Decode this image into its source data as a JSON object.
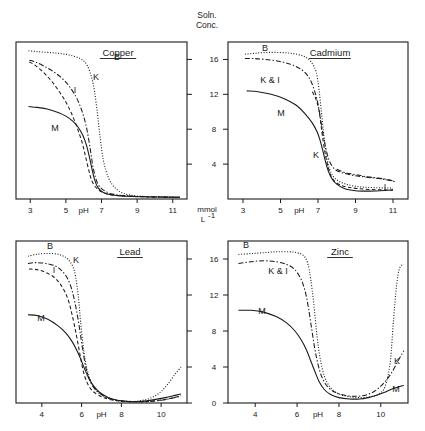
{
  "figure": {
    "axis_title_line1": "Soln.",
    "axis_title_line2": "Conc.",
    "unit_line1": "mmol",
    "unit_line2": "L",
    "unit_sup": "-1",
    "xlabel": "pH"
  },
  "chart_data": [
    {
      "type": "line",
      "title": "Copper",
      "panel": "top-left",
      "xlabel": "pH",
      "ylabel": "Soln. Conc. (mmol L-1)",
      "xlim": [
        2.2,
        11.8
      ],
      "ylim": [
        0,
        18
      ],
      "xticks": [
        3,
        5,
        7,
        9,
        11
      ],
      "xtick_labels": [
        "3",
        "5",
        "7",
        "9",
        "11"
      ],
      "yticks": [
        4,
        8,
        12,
        16
      ],
      "ytick_labels": [
        "4",
        "8",
        "12",
        "16"
      ],
      "grid": false,
      "legend": "inline curve labels",
      "series": [
        {
          "name": "B",
          "label": "B",
          "style": "dotted",
          "x": [
            2.9,
            3.4,
            4.0,
            4.6,
            5.2,
            5.8,
            6.2,
            6.5,
            6.7,
            6.9,
            7.1,
            7.4,
            7.8,
            8.3,
            9.0,
            10.0,
            11.4
          ],
          "y": [
            17.0,
            16.9,
            16.8,
            16.7,
            16.5,
            16.1,
            15.3,
            13.5,
            11.0,
            7.5,
            4.5,
            2.4,
            1.2,
            0.6,
            0.35,
            0.25,
            0.2
          ]
        },
        {
          "name": "K",
          "label": "K",
          "style": "dash-dot",
          "x": [
            2.95,
            3.3,
            3.8,
            4.3,
            4.8,
            5.2,
            5.6,
            5.9,
            6.1,
            6.25,
            6.4,
            6.55,
            6.8,
            7.2,
            7.8,
            8.6,
            9.6,
            11.4
          ],
          "y": [
            15.9,
            15.7,
            15.2,
            14.6,
            13.8,
            12.9,
            11.6,
            10.1,
            8.7,
            7.2,
            5.3,
            3.4,
            1.7,
            0.9,
            0.5,
            0.35,
            0.25,
            0.2
          ]
        },
        {
          "name": "I",
          "label": "I",
          "style": "dashed",
          "x": [
            2.95,
            3.3,
            3.8,
            4.2,
            4.6,
            4.95,
            5.25,
            5.5,
            5.75,
            5.95,
            6.1,
            6.3,
            6.5,
            6.9,
            7.5,
            8.3,
            9.4,
            11.4
          ],
          "y": [
            15.7,
            15.3,
            14.4,
            13.5,
            12.4,
            11.3,
            10.1,
            8.9,
            7.5,
            6.2,
            4.9,
            3.2,
            1.9,
            0.95,
            0.5,
            0.35,
            0.25,
            0.2
          ]
        },
        {
          "name": "M",
          "label": "M",
          "style": "solid",
          "x": [
            2.9,
            3.4,
            4.0,
            4.6,
            5.0,
            5.4,
            5.7,
            5.95,
            6.15,
            6.3,
            6.45,
            6.6,
            6.8,
            7.1,
            7.6,
            8.3,
            9.3,
            11.4
          ],
          "y": [
            10.6,
            10.5,
            10.3,
            9.9,
            9.5,
            8.9,
            8.2,
            7.3,
            6.2,
            5.0,
            3.6,
            2.3,
            1.3,
            0.75,
            0.45,
            0.32,
            0.25,
            0.2
          ]
        }
      ]
    },
    {
      "type": "line",
      "title": "Cadmium",
      "panel": "top-right",
      "xlabel": "pH",
      "ylabel": "Soln. Conc. (mmol L-1)",
      "xlim": [
        2.2,
        11.8
      ],
      "ylim": [
        0,
        18
      ],
      "xticks": [
        3,
        5,
        7,
        9,
        11
      ],
      "xtick_labels": [
        "3",
        "5",
        "7",
        "9",
        "11"
      ],
      "yticks": [
        4,
        8,
        12,
        16
      ],
      "ytick_labels": [
        "4",
        "8",
        "12",
        "16"
      ],
      "grid": false,
      "legend": "inline curve labels",
      "series": [
        {
          "name": "B",
          "label": "B",
          "style": "dotted",
          "x": [
            3.1,
            3.6,
            4.2,
            4.9,
            5.6,
            6.2,
            6.6,
            6.9,
            7.05,
            7.2,
            7.35,
            7.5,
            7.7,
            8.0,
            8.5,
            9.2,
            10.0,
            11.0
          ],
          "y": [
            16.6,
            16.7,
            16.8,
            16.8,
            16.7,
            16.4,
            15.8,
            14.6,
            12.6,
            9.6,
            6.6,
            4.4,
            3.0,
            2.2,
            1.7,
            1.4,
            1.3,
            1.25
          ]
        },
        {
          "name": "K",
          "label": "K & I",
          "style": "dash-dot",
          "x": [
            3.1,
            3.6,
            4.2,
            4.9,
            5.6,
            6.2,
            6.6,
            6.9,
            7.05,
            7.2,
            7.4,
            7.6,
            7.9,
            8.3,
            8.9,
            9.6,
            10.4,
            11.1
          ],
          "y": [
            16.1,
            16.1,
            16.0,
            15.8,
            15.4,
            14.7,
            13.6,
            11.8,
            10.3,
            8.3,
            6.0,
            4.4,
            3.4,
            3.0,
            2.7,
            2.5,
            2.3,
            2.0
          ]
        },
        {
          "name": "K2",
          "label": "K",
          "style": "dashed",
          "x": [
            6.7,
            6.9,
            7.05,
            7.15,
            7.25,
            7.4,
            7.55,
            7.7,
            7.9,
            8.2,
            8.6,
            9.1,
            9.7,
            10.4,
            11.0
          ],
          "y": [
            12.3,
            11.4,
            10.2,
            8.7,
            7.0,
            5.0,
            3.6,
            2.6,
            2.0,
            1.6,
            1.35,
            1.2,
            1.1,
            1.05,
            1.0
          ]
        },
        {
          "name": "I",
          "label": "I",
          "style": "dash-dot",
          "x": [
            8.0,
            8.5,
            9.0,
            9.6,
            10.2,
            10.8,
            11.1
          ],
          "y": [
            3.4,
            3.0,
            2.8,
            2.55,
            2.4,
            2.2,
            2.0
          ]
        },
        {
          "name": "M",
          "label": "M",
          "style": "solid",
          "x": [
            3.2,
            3.8,
            4.5,
            5.2,
            5.8,
            6.3,
            6.7,
            6.95,
            7.1,
            7.25,
            7.4,
            7.55,
            7.75,
            8.0,
            8.4,
            9.0,
            9.6,
            10.3,
            11.0
          ],
          "y": [
            12.4,
            12.3,
            12.0,
            11.5,
            10.8,
            9.8,
            8.7,
            7.7,
            6.8,
            5.6,
            4.3,
            3.2,
            2.3,
            1.7,
            1.2,
            0.95,
            0.9,
            0.95,
            1.05
          ]
        }
      ]
    },
    {
      "type": "line",
      "title": "Lead",
      "panel": "bottom-left",
      "xlabel": "pH",
      "ylabel": "Soln. Conc. (mmol L-1)",
      "xlim": [
        2.7,
        11.3
      ],
      "ylim": [
        0,
        18
      ],
      "xticks": [
        4,
        6,
        8,
        10
      ],
      "xtick_labels": [
        "4",
        "6",
        "8",
        "10"
      ],
      "yticks": [
        0,
        4,
        8,
        12,
        16
      ],
      "ytick_labels": [
        "0",
        "4",
        "8",
        "12",
        "16"
      ],
      "grid": false,
      "legend": "inline curve labels",
      "series": [
        {
          "name": "B",
          "label": "B",
          "style": "dotted",
          "x": [
            3.3,
            3.7,
            4.1,
            4.6,
            5.0,
            5.3,
            5.55,
            5.7,
            5.85,
            5.95,
            6.1,
            6.3,
            6.6,
            7.0,
            7.6,
            8.2,
            8.8,
            9.4,
            9.9,
            10.3,
            10.7,
            11.0
          ],
          "y": [
            16.3,
            16.5,
            16.6,
            16.6,
            16.4,
            16.0,
            15.2,
            14.0,
            11.5,
            9.0,
            6.0,
            3.5,
            1.8,
            0.9,
            0.35,
            0.15,
            0.2,
            0.5,
            1.1,
            2.0,
            3.2,
            4.0
          ]
        },
        {
          "name": "K",
          "label": "K",
          "style": "dash-dot",
          "x": [
            3.3,
            3.7,
            4.2,
            4.7,
            5.0,
            5.25,
            5.45,
            5.6,
            5.75,
            5.9,
            6.05,
            6.25,
            6.55,
            7.0,
            7.6,
            8.3,
            9.2,
            10.0,
            10.7,
            11.0
          ],
          "y": [
            15.5,
            15.6,
            15.5,
            15.2,
            14.7,
            14.0,
            13.0,
            11.8,
            10.2,
            8.2,
            6.0,
            3.6,
            1.9,
            0.95,
            0.4,
            0.2,
            0.15,
            0.3,
            0.6,
            0.8
          ]
        },
        {
          "name": "I",
          "label": "I",
          "style": "dashed",
          "x": [
            3.35,
            3.8,
            4.2,
            4.6,
            4.9,
            5.15,
            5.35,
            5.5,
            5.65,
            5.8,
            5.95,
            6.15,
            6.45,
            6.9,
            7.5,
            8.2,
            9.2,
            10.2,
            11.0
          ],
          "y": [
            14.9,
            14.8,
            14.5,
            14.0,
            13.3,
            12.4,
            11.3,
            10.0,
            8.5,
            6.8,
            5.0,
            3.0,
            1.6,
            0.8,
            0.35,
            0.18,
            0.15,
            0.4,
            0.8
          ]
        },
        {
          "name": "M",
          "label": "M",
          "style": "solid",
          "x": [
            3.3,
            3.8,
            4.3,
            4.8,
            5.2,
            5.5,
            5.75,
            5.95,
            6.15,
            6.35,
            6.6,
            6.9,
            7.3,
            7.8,
            8.4,
            9.0,
            9.6,
            10.2,
            10.7,
            11.0
          ],
          "y": [
            9.8,
            9.7,
            9.3,
            8.6,
            7.8,
            6.9,
            5.9,
            4.9,
            3.8,
            2.8,
            1.9,
            1.2,
            0.65,
            0.3,
            0.15,
            0.18,
            0.35,
            0.6,
            0.85,
            1.0
          ]
        }
      ]
    },
    {
      "type": "line",
      "title": "Zinc",
      "panel": "bottom-right",
      "xlabel": "pH",
      "ylabel": "Soln. Conc. (mmol L-1)",
      "xlim": [
        2.7,
        11.3
      ],
      "ylim": [
        0,
        18
      ],
      "xticks": [
        4,
        6,
        8,
        10
      ],
      "xtick_labels": [
        "4",
        "6",
        "8",
        "10"
      ],
      "yticks": [
        0,
        4,
        8,
        12,
        16
      ],
      "ytick_labels": [
        "0",
        "4",
        "8",
        "12",
        "16"
      ],
      "grid": false,
      "legend": "inline curve labels",
      "series": [
        {
          "name": "B",
          "label": "B",
          "style": "dotted",
          "x": [
            3.2,
            3.8,
            4.4,
            5.0,
            5.6,
            6.0,
            6.3,
            6.5,
            6.65,
            6.8,
            6.95,
            7.1,
            7.3,
            7.6,
            8.0,
            8.5,
            9.0,
            9.5,
            9.9,
            10.2,
            10.45,
            10.6,
            10.75,
            10.9,
            11.1
          ],
          "y": [
            16.5,
            16.6,
            16.7,
            16.8,
            16.8,
            16.7,
            16.4,
            15.6,
            13.8,
            11.0,
            7.5,
            5.0,
            3.0,
            1.7,
            1.0,
            0.7,
            0.6,
            0.7,
            1.0,
            1.8,
            4.5,
            9.0,
            13.0,
            15.0,
            15.4
          ]
        },
        {
          "name": "KI",
          "label": "K & I",
          "style": "dash-dot",
          "x": [
            3.2,
            3.8,
            4.4,
            5.0,
            5.5,
            5.9,
            6.2,
            6.4,
            6.55,
            6.7,
            6.85,
            7.0,
            7.2,
            7.5,
            7.9,
            8.4,
            8.9,
            9.3,
            9.7,
            10.1,
            10.5,
            10.9,
            11.1
          ],
          "y": [
            15.5,
            15.7,
            15.8,
            15.7,
            15.4,
            14.8,
            13.7,
            12.3,
            10.5,
            8.2,
            6.0,
            4.3,
            2.8,
            1.7,
            1.1,
            0.8,
            0.75,
            0.9,
            1.3,
            2.1,
            3.3,
            5.0,
            5.8
          ]
        },
        {
          "name": "M",
          "label": "M",
          "style": "solid",
          "x": [
            3.2,
            3.8,
            4.4,
            5.0,
            5.5,
            5.9,
            6.2,
            6.45,
            6.65,
            6.85,
            7.05,
            7.3,
            7.6,
            8.0,
            8.5,
            9.0,
            9.4,
            9.8,
            10.2,
            10.6,
            11.0,
            11.1
          ],
          "y": [
            10.3,
            10.3,
            10.1,
            9.6,
            8.9,
            8.0,
            7.0,
            5.9,
            4.7,
            3.5,
            2.4,
            1.5,
            0.95,
            0.6,
            0.45,
            0.45,
            0.6,
            0.85,
            1.2,
            1.6,
            1.9,
            1.95
          ]
        }
      ]
    }
  ]
}
